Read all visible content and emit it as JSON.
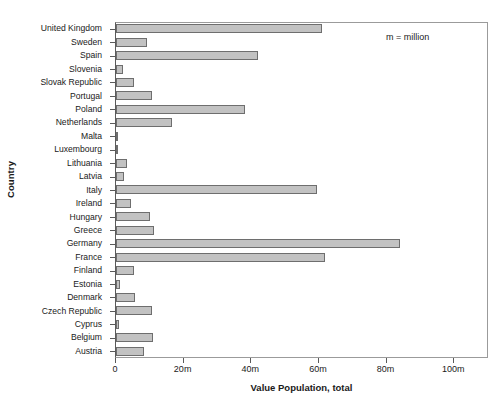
{
  "chart_data": {
    "type": "bar",
    "orientation": "horizontal",
    "title": "",
    "xlabel": "Value Population, total",
    "ylabel": "Country",
    "xlim": [
      0,
      110
    ],
    "x_unit": "million",
    "x_ticks": [
      0,
      20,
      40,
      60,
      80,
      100
    ],
    "x_tick_labels": [
      "0",
      "20m",
      "40m",
      "60m",
      "80m",
      "100m"
    ],
    "grid": false,
    "legend": null,
    "annotations": [
      {
        "text": "m = million",
        "x": 88,
        "y": "top-right"
      }
    ],
    "bar_fill_color": "#c2c2c2",
    "bar_border_color": "#6e6e6e",
    "axis_color": "#5a5a5a",
    "background_color": "#ffffff",
    "categories": [
      "United Kingdom",
      "Sweden",
      "Spain",
      "Slovenia",
      "Slovak Republic",
      "Portugal",
      "Poland",
      "Netherlands",
      "Malta",
      "Luxembourg",
      "Lithuania",
      "Latvia",
      "Italy",
      "Ireland",
      "Hungary",
      "Greece",
      "Germany",
      "France",
      "Finland",
      "Estonia",
      "Denmark",
      "Czech Republic",
      "Cyprus",
      "Belgium",
      "Austria"
    ],
    "values": [
      61.0,
      9.3,
      42.0,
      2.0,
      5.4,
      10.6,
      38.2,
      16.5,
      0.4,
      0.5,
      3.3,
      2.3,
      59.5,
      4.4,
      10.1,
      11.2,
      84.0,
      61.8,
      5.3,
      1.3,
      5.5,
      10.5,
      0.8,
      11.0,
      8.3
    ]
  }
}
